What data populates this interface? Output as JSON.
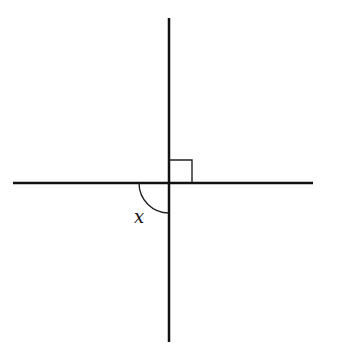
{
  "diagram": {
    "type": "geometry-intersecting-lines",
    "colors": {
      "line": "#111111",
      "background": "#ffffff"
    },
    "horizontal_line": {
      "x1": 13,
      "y1": 183,
      "x2": 313,
      "y2": 183
    },
    "vertical_line": {
      "x1": 169,
      "y1": 18,
      "x2": 169,
      "y2": 342
    },
    "right_angle_marker": {
      "x": 169,
      "y": 160,
      "size": 23,
      "quadrant": "upper-right"
    },
    "angle_arc": {
      "cx": 169,
      "cy": 183,
      "r": 30,
      "quadrant": "lower-left"
    },
    "angle_label": {
      "text": "x",
      "x": 134,
      "y": 223
    }
  }
}
